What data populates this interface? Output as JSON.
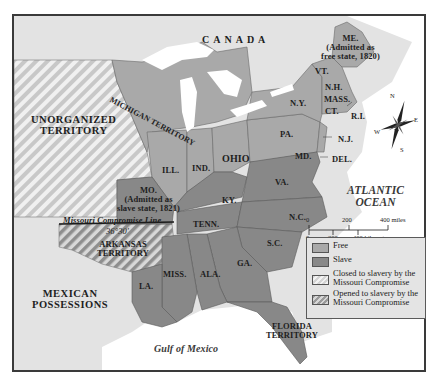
{
  "map": {
    "title_regions": {
      "canada": "CANADA",
      "unorganized_territory": [
        "UNORGANIZED",
        "TERRITORY"
      ],
      "michigan_territory": "MICHIGAN TERRITORY",
      "mexican_possessions": [
        "MEXICAN",
        "POSSESSIONS"
      ],
      "arkansas_territory": [
        "ARKANSAS",
        "TERRITORY"
      ],
      "florida_territory": [
        "FLORIDA",
        "TERRITORY"
      ]
    },
    "states": {
      "me": [
        "ME.",
        "(Admitted as",
        "free state, 1820)"
      ],
      "vt": "VT.",
      "nh": "N.H.",
      "mass": "MASS.",
      "ct": "CT.",
      "ri": "R.I.",
      "ny": "N.Y.",
      "nj": "N.J.",
      "pa": "PA.",
      "del": "DEL.",
      "md": "MD.",
      "ohio": "OHIO",
      "ind": "IND.",
      "ill": "ILL.",
      "mo": [
        "MO.",
        "(Admitted as",
        "slave state, 1821)"
      ],
      "ky": "KY.",
      "va": "VA.",
      "nc": "N.C.",
      "tenn": "TENN.",
      "sc": "S.C.",
      "ga": "GA.",
      "ala": "ALA.",
      "miss": "MISS.",
      "la": "LA."
    },
    "water": {
      "atlantic": [
        "ATLANTIC",
        "OCEAN"
      ],
      "gulf": "Gulf of Mexico"
    },
    "compromise_line": {
      "label": "Missouri Compromise Line",
      "latitude": "36°30′"
    },
    "compass": {
      "n": "N",
      "s": "S",
      "e": "E",
      "w": "W"
    },
    "scale": {
      "miles": [
        "0",
        "200",
        "400 miles"
      ],
      "km": [
        "0",
        "200",
        "400 kilometers"
      ]
    },
    "legend": [
      {
        "key": "free",
        "label": "Free",
        "color": "#a9a9a9"
      },
      {
        "key": "slave",
        "label": "Slave",
        "color": "#888888"
      },
      {
        "key": "closed",
        "label": "Closed to slavery by the Missouri Compromise"
      },
      {
        "key": "opened",
        "label": "Opened to slavery by the Missouri Compromise"
      }
    ],
    "colors": {
      "land_other": "#e2e2e2",
      "water": "#ffffff",
      "free": "#a9a9a9",
      "slave": "#888888",
      "border": "#3a3a3a"
    }
  }
}
